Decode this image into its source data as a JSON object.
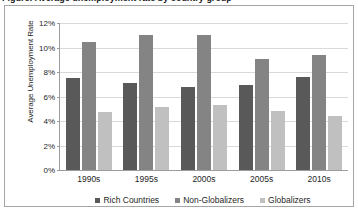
{
  "page": {
    "cut_off_title": "Figure: Average unemployment rate by country group"
  },
  "chart_data": {
    "type": "bar",
    "title": "",
    "xlabel": "",
    "ylabel": "Average Unemployment Rate",
    "categories": [
      "1990s",
      "1995s",
      "2000s",
      "2005s",
      "2010s"
    ],
    "series": [
      {
        "name": "Rich Countries",
        "color": "#595959",
        "values": [
          7.55,
          7.1,
          6.75,
          6.95,
          7.6
        ]
      },
      {
        "name": "Non-Globalizers",
        "color": "#848484",
        "values": [
          10.45,
          11.0,
          11.05,
          9.1,
          9.35
        ]
      },
      {
        "name": "Globalizers",
        "color": "#c0c0c0",
        "values": [
          4.7,
          5.15,
          5.3,
          4.85,
          4.45
        ]
      }
    ],
    "ylim": [
      0,
      12
    ],
    "ytick_values": [
      0,
      2,
      4,
      6,
      8,
      10,
      12
    ],
    "ytick_labels": [
      "0%",
      "2%",
      "4%",
      "6%",
      "8%",
      "10%",
      "12%"
    ],
    "grid": true,
    "legend_position": "bottom"
  }
}
